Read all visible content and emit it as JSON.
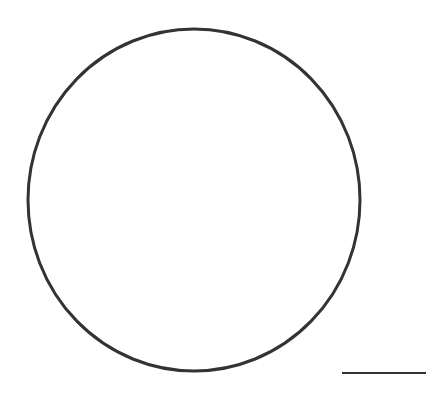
{
  "diagram": {
    "background": "#ffffff",
    "circle": {
      "cx": 194,
      "cy": 200,
      "rx": 166,
      "ry": 171,
      "stroke": "#333333",
      "stroke_width": 3
    },
    "scale_bar": {
      "x1": 342,
      "y1": 373,
      "x2": 426,
      "y2": 373,
      "stroke": "#333333",
      "stroke_width": 2
    }
  }
}
